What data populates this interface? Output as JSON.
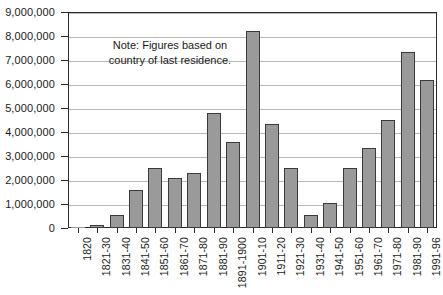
{
  "chart_data": {
    "type": "bar",
    "title": "",
    "subtitle": "",
    "xlabel": "",
    "ylabel": "",
    "ylim": [
      0,
      9000000
    ],
    "ytick_step": 1000000,
    "grid": "horizontal",
    "legend": "none",
    "bar_color": "#9a9a9a",
    "bar_border_color": "#3a3a3a",
    "gridline_color": "#b9b9b9",
    "axis_color": "#2b2b2b",
    "categories": [
      "1820",
      "1821-30",
      "1831-40",
      "1841-50",
      "1851-60",
      "1861-70",
      "1871-80",
      "1881-90",
      "1891-1900",
      "1901-10",
      "1911-20",
      "1921-30",
      "1931-40",
      "1941-50",
      "1951-60",
      "1961-70",
      "1971-80",
      "1981-90",
      "1991-96"
    ],
    "values": [
      8000,
      130000,
      540000,
      1590000,
      2500000,
      2080000,
      2300000,
      4800000,
      3600000,
      8200000,
      4350000,
      2480000,
      530000,
      1030000,
      2510000,
      3320000,
      4490000,
      7340000,
      6150000
    ],
    "ytick_labels": [
      "0",
      "1,000,000",
      "2,000,000",
      "3,000,000",
      "4,000,000",
      "5,000,000",
      "6,000,000",
      "7,000,000",
      "8,000,000",
      "9,000,000"
    ],
    "ytick_values": [
      0,
      1000000,
      2000000,
      3000000,
      4000000,
      5000000,
      6000000,
      7000000,
      8000000,
      9000000
    ],
    "annotations": [
      {
        "name": "figures-note",
        "lines": [
          "Note: Figures based on",
          "country of last residence."
        ]
      }
    ]
  },
  "note": {
    "line1": "Note: Figures based on",
    "line2": "country of last residence."
  }
}
